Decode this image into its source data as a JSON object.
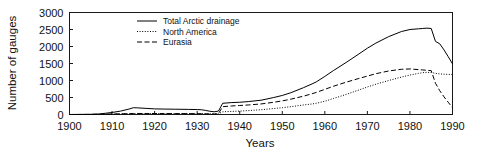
{
  "chart_data": {
    "type": "line",
    "title": "",
    "xlabel": "Years",
    "ylabel": "Number of gauges",
    "xlim": [
      1900,
      1990
    ],
    "ylim": [
      0,
      3000
    ],
    "xticks": [
      1900,
      1910,
      1920,
      1930,
      1940,
      1950,
      1960,
      1970,
      1980,
      1990
    ],
    "yticks": [
      0,
      500,
      1000,
      1500,
      2000,
      2500,
      3000
    ],
    "grid": false,
    "legend_position": "top-center",
    "x": [
      1900,
      1905,
      1907,
      1910,
      1912,
      1914,
      1915,
      1916,
      1918,
      1920,
      1922,
      1925,
      1928,
      1930,
      1931,
      1932,
      1933,
      1934,
      1935,
      1936,
      1937,
      1938,
      1940,
      1942,
      1945,
      1948,
      1950,
      1952,
      1955,
      1957,
      1958,
      1960,
      1962,
      1965,
      1968,
      1970,
      1972,
      1975,
      1978,
      1980,
      1982,
      1983,
      1984,
      1985,
      1986,
      1987,
      1988,
      1989,
      1990
    ],
    "series": [
      {
        "name": "Total Arctic drainage",
        "style": "solid",
        "color": "#000000",
        "values": [
          0,
          5,
          15,
          60,
          100,
          160,
          200,
          195,
          180,
          165,
          160,
          155,
          150,
          145,
          140,
          120,
          95,
          80,
          100,
          330,
          340,
          350,
          360,
          380,
          420,
          500,
          560,
          640,
          790,
          900,
          960,
          1120,
          1290,
          1530,
          1780,
          1950,
          2100,
          2290,
          2440,
          2500,
          2520,
          2530,
          2540,
          2530,
          2150,
          2080,
          1900,
          1700,
          1490
        ]
      },
      {
        "name": "North America",
        "style": "dotted",
        "color": "#000000",
        "values": [
          0,
          2,
          5,
          10,
          15,
          20,
          25,
          25,
          25,
          25,
          25,
          25,
          25,
          25,
          25,
          22,
          18,
          15,
          20,
          80,
          85,
          90,
          100,
          115,
          140,
          175,
          200,
          230,
          280,
          310,
          330,
          390,
          470,
          590,
          720,
          810,
          890,
          1000,
          1100,
          1160,
          1210,
          1230,
          1240,
          1235,
          1210,
          1195,
          1185,
          1180,
          1175
        ]
      },
      {
        "name": "Eurasia",
        "style": "dashed",
        "color": "#000000",
        "values": [
          0,
          3,
          8,
          15,
          20,
          25,
          30,
          30,
          30,
          28,
          28,
          26,
          25,
          24,
          22,
          20,
          18,
          15,
          25,
          230,
          240,
          250,
          265,
          280,
          310,
          360,
          400,
          450,
          540,
          610,
          650,
          740,
          830,
          950,
          1060,
          1130,
          1200,
          1280,
          1330,
          1340,
          1320,
          1310,
          1300,
          1290,
          920,
          700,
          520,
          360,
          200
        ]
      }
    ]
  },
  "legend": {
    "entries": [
      {
        "label": "Total Arctic drainage",
        "style": "solid"
      },
      {
        "label": "North America",
        "style": "dotted"
      },
      {
        "label": "Eurasia",
        "style": "dashed"
      }
    ]
  }
}
